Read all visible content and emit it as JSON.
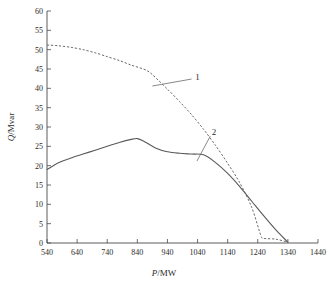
{
  "chart_data": {
    "type": "line",
    "title": "",
    "xlabel": "P/MW",
    "xlabel_italic_part": "P",
    "xlabel_rest": "/MW",
    "ylabel": "Q/Mvar",
    "ylabel_italic_part": "Q",
    "ylabel_rest": "/Mvar",
    "xlim": [
      540,
      1440
    ],
    "ylim": [
      0,
      60
    ],
    "xticks": [
      540,
      640,
      740,
      840,
      940,
      1040,
      1140,
      1240,
      1340,
      1440
    ],
    "yticks": [
      0,
      5,
      10,
      15,
      20,
      25,
      30,
      35,
      40,
      45,
      50,
      55,
      60
    ],
    "grid": false,
    "legend_position": "inline-annotations",
    "series": [
      {
        "name": "1",
        "style": "dashed",
        "color": "#6a6a6a",
        "x": [
          540,
          580,
          620,
          660,
          700,
          740,
          780,
          820,
          860,
          880,
          900,
          940,
          980,
          1020,
          1060,
          1100,
          1140,
          1180,
          1220,
          1250,
          1260,
          1300,
          1340
        ],
        "y": [
          51.2,
          51.0,
          50.6,
          50.0,
          49.2,
          48.2,
          47.2,
          46.0,
          45.0,
          44.2,
          42.8,
          39.8,
          36.6,
          33.2,
          29.4,
          25.2,
          20.6,
          15.6,
          9.2,
          2.0,
          1.2,
          1.0,
          0.2
        ]
      },
      {
        "name": "2",
        "style": "solid",
        "color": "#5a5a5a",
        "x": [
          540,
          580,
          620,
          660,
          700,
          740,
          780,
          820,
          840,
          860,
          900,
          940,
          980,
          1020,
          1060,
          1100,
          1140,
          1180,
          1220,
          1260,
          1300,
          1340
        ],
        "y": [
          19.0,
          20.8,
          22.0,
          23.0,
          24.0,
          25.0,
          26.0,
          26.8,
          27.0,
          26.4,
          24.6,
          23.6,
          23.2,
          23.0,
          22.8,
          20.8,
          18.0,
          14.6,
          10.8,
          7.0,
          3.4,
          0.2
        ]
      }
    ],
    "annotations": [
      {
        "label": "1",
        "label_x": 1040,
        "label_y": 43.0,
        "leader_from_x": 1020,
        "leader_from_y": 42.4,
        "leader_to_x": 890,
        "leader_to_y": 40.6
      },
      {
        "label": "2",
        "label_x": 1095,
        "label_y": 28.6,
        "leader_from_x": 1082,
        "leader_from_y": 27.6,
        "leader_to_x": 1038,
        "leader_to_y": 21.2
      }
    ]
  }
}
